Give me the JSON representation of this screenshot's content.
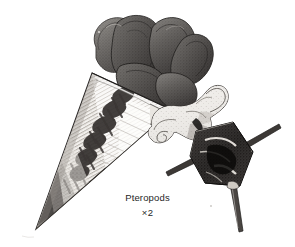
{
  "plate": {
    "background_color": "#ffffff",
    "ink_color": "#262626",
    "width": 295,
    "height": 247,
    "medium": "stipple-and-line engraving, grayscale"
  },
  "caption": {
    "title": "Pteropods",
    "magnification": "×2"
  },
  "specimens": [
    {
      "id": "conical-pteropod",
      "label": "conical shelled pteropod with dark lobed wings",
      "shell_shape": "elongate cone / tusk",
      "shell_tone": "#f2f0ec",
      "shell_markings": "dark mottled comb-like blotches with fine horizontal striations",
      "wing_tone": "#585654",
      "orientation": "diagonal, apex lower-left, aperture upper-right"
    },
    {
      "id": "cavolinia-pteropod",
      "label": "spined pteropod with pale curled wings",
      "shell_shape": "angular globose with three spines",
      "shell_tone": "#1d1b1a",
      "wing_tone": "#d8d4cd",
      "spine_count": 3,
      "orientation": "upright, wings to the left"
    }
  ],
  "icons": {
    "plate": "engraving-plate-icon"
  }
}
